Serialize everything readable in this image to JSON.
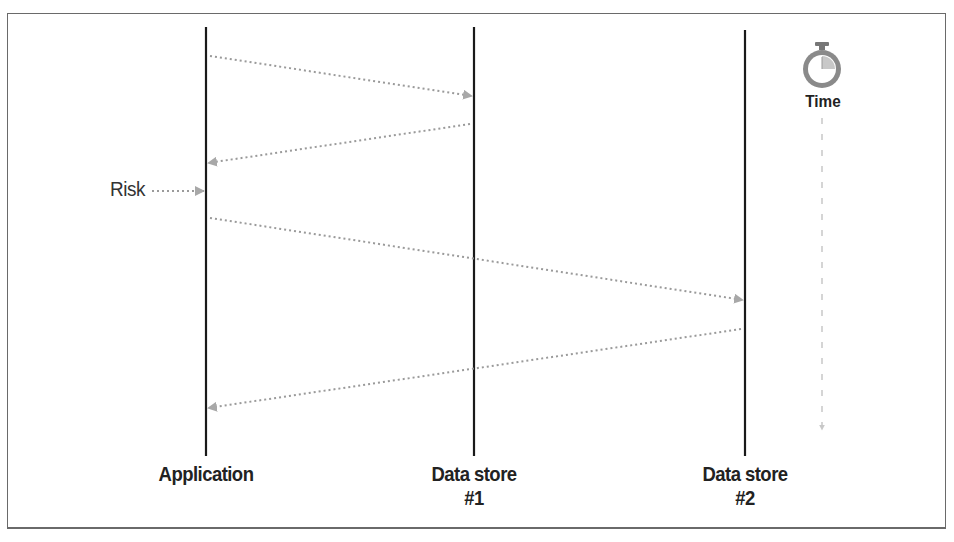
{
  "diagram": {
    "type": "sequence",
    "lifelines": [
      {
        "id": "application",
        "label": "Application",
        "x": 206
      },
      {
        "id": "datastore1",
        "label_line1": "Data store",
        "label_line2": "#1",
        "x": 474
      },
      {
        "id": "datastore2",
        "label_line1": "Data store",
        "label_line2": "#2",
        "x": 745
      }
    ],
    "messages": [
      {
        "from": "application",
        "to": "datastore1",
        "y_start": 56,
        "y_end": 96
      },
      {
        "from": "datastore1",
        "to": "application",
        "y_start": 124,
        "y_end": 163
      },
      {
        "from": "application",
        "to": "datastore2",
        "y_start": 218,
        "y_end": 300
      },
      {
        "from": "datastore2",
        "to": "application",
        "y_start": 329,
        "y_end": 408
      }
    ],
    "annotations": {
      "risk_label": "Risk",
      "time_label": "Time",
      "time_icon": "stopwatch-icon"
    },
    "colors": {
      "lifeline": "#1a1a1a",
      "message": "#9a9a9a",
      "time_arrow": "#bdbdbd",
      "frame": "#6a6a6a"
    }
  }
}
